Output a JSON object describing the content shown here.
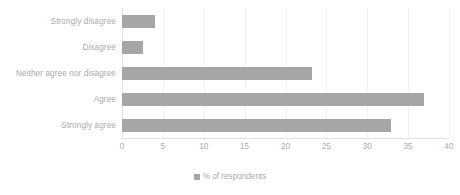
{
  "chart_data": {
    "type": "bar",
    "orientation": "horizontal",
    "title": "",
    "subtitle": "",
    "xlabel": "",
    "ylabel": "",
    "categories": [
      "Strongly disagree",
      "Disagree",
      "Neither agree nor disagree",
      "Agree",
      "Strongly agree"
    ],
    "values": [
      4.0,
      2.6,
      23.2,
      36.9,
      32.9
    ],
    "series": [
      {
        "name": "% of respondents",
        "values": [
          4.0,
          2.6,
          23.2,
          36.9,
          32.9
        ],
        "color": "#a6a6a6"
      }
    ],
    "xlim": [
      0,
      40
    ],
    "xticks": [
      0,
      5,
      10,
      15,
      20,
      25,
      30,
      35,
      40
    ],
    "xtick_labels": [
      "0",
      "5",
      "10",
      "15",
      "20",
      "25",
      "30",
      "35",
      "40"
    ],
    "grid": true,
    "grid_axis": "x",
    "legend": {
      "position": "bottom-center",
      "entries": [
        {
          "label": "% of respondents",
          "marker": "square",
          "color": "#a6a6a6"
        }
      ]
    }
  },
  "colors": {
    "bar": "#a6a6a6",
    "text": "#a9a9a9",
    "gridline": "#f2f2f2",
    "axis": "#e0e0e0",
    "background": "#ffffff"
  },
  "legend": {
    "label": "% of respondents",
    "marker_name": "legend-square-marker"
  }
}
